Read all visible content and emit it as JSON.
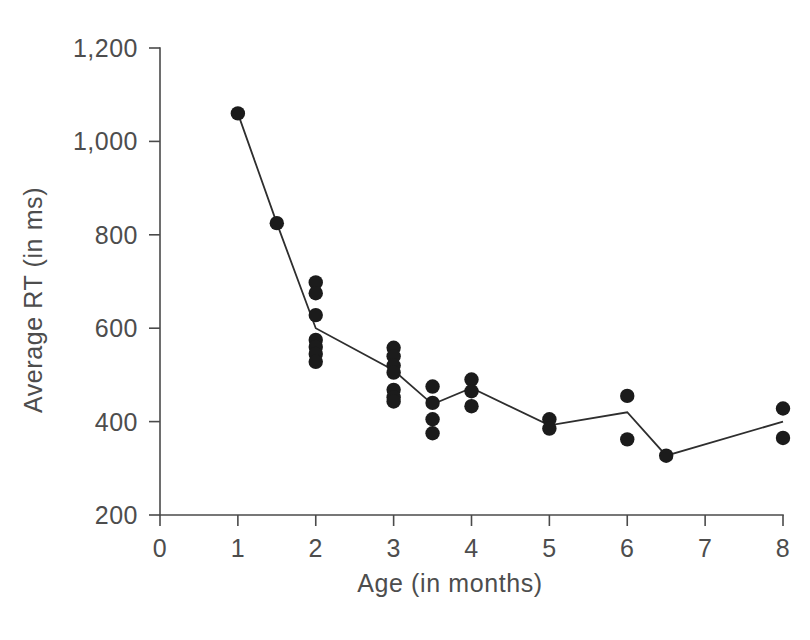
{
  "chart_data": {
    "type": "scatter",
    "title": "",
    "xlabel": "Age (in months)",
    "ylabel": "Average RT (in ms)",
    "xlim": [
      0,
      8
    ],
    "ylim": [
      200,
      1200
    ],
    "xticks": [
      0,
      1,
      2,
      3,
      4,
      5,
      6,
      7,
      8
    ],
    "xtick_labels": [
      "0",
      "1",
      "2",
      "3",
      "4",
      "5",
      "6",
      "7",
      "8"
    ],
    "yticks": [
      200,
      400,
      600,
      800,
      1000,
      1200
    ],
    "ytick_labels": [
      "200",
      "400",
      "600",
      "800",
      "1,000",
      "1,200"
    ],
    "grid": false,
    "legend": "none",
    "series": [
      {
        "name": "Mean RT",
        "type": "line",
        "x": [
          1,
          1.5,
          2,
          3,
          3.5,
          4,
          5,
          6,
          6.5,
          8
        ],
        "values": [
          1060,
          825,
          600,
          510,
          437,
          472,
          392,
          420,
          327,
          400
        ]
      },
      {
        "name": "Individual infant means",
        "type": "scatter",
        "points": [
          {
            "x": 1,
            "y": 1060
          },
          {
            "x": 1.5,
            "y": 825
          },
          {
            "x": 2,
            "y": 698
          },
          {
            "x": 2,
            "y": 675
          },
          {
            "x": 2,
            "y": 628
          },
          {
            "x": 2,
            "y": 575
          },
          {
            "x": 2,
            "y": 560
          },
          {
            "x": 2,
            "y": 545
          },
          {
            "x": 2,
            "y": 528
          },
          {
            "x": 3,
            "y": 558
          },
          {
            "x": 3,
            "y": 540
          },
          {
            "x": 3,
            "y": 520
          },
          {
            "x": 3,
            "y": 505
          },
          {
            "x": 3,
            "y": 468
          },
          {
            "x": 3,
            "y": 452
          },
          {
            "x": 3,
            "y": 443
          },
          {
            "x": 3.5,
            "y": 475
          },
          {
            "x": 3.5,
            "y": 440
          },
          {
            "x": 3.5,
            "y": 405
          },
          {
            "x": 3.5,
            "y": 375
          },
          {
            "x": 4,
            "y": 490
          },
          {
            "x": 4,
            "y": 465
          },
          {
            "x": 4,
            "y": 433
          },
          {
            "x": 5,
            "y": 405
          },
          {
            "x": 5,
            "y": 385
          },
          {
            "x": 6,
            "y": 455
          },
          {
            "x": 6,
            "y": 362
          },
          {
            "x": 6.5,
            "y": 327
          },
          {
            "x": 8,
            "y": 428
          },
          {
            "x": 8,
            "y": 365
          }
        ]
      }
    ]
  },
  "style": {
    "line_color": "#2e2e2e",
    "dot_color": "#1b1b1b",
    "axis_color": "#4a4a4a",
    "text_color": "#4d4d4d",
    "background": "#ffffff"
  }
}
